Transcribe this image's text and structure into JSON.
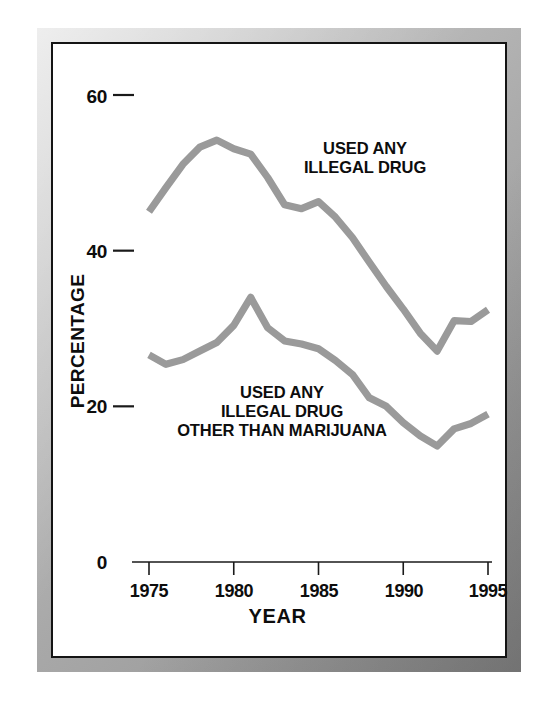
{
  "chart_data": {
    "type": "line",
    "title": "",
    "xlabel": "YEAR",
    "ylabel": "PERCENTAGE",
    "xlim": [
      1975,
      1995
    ],
    "ylim": [
      0,
      60
    ],
    "yticks": [
      0,
      20,
      40,
      60
    ],
    "ytick_labels": [
      "0",
      "20",
      "40",
      "60"
    ],
    "xticks": [
      1975,
      1980,
      1985,
      1990,
      1995
    ],
    "xtick_labels": [
      "1975",
      "1980",
      "1985",
      "1990",
      "1995"
    ],
    "grid": false,
    "legend_position": "inline-annotation",
    "line_color": "#9a9a9a",
    "axis_color": "#1a1a1a",
    "series": [
      {
        "name": "USED ANY ILLEGAL DRUG",
        "annotation": "USED ANY\nILLEGAL DRUG",
        "annotation_line_1": "USED ANY",
        "annotation_line_2": "ILLEGAL DRUG",
        "x": [
          1975,
          1976,
          1977,
          1978,
          1979,
          1980,
          1981,
          1982,
          1983,
          1984,
          1985,
          1986,
          1987,
          1988,
          1989,
          1990,
          1991,
          1992,
          1993,
          1994,
          1995
        ],
        "values": [
          45.0,
          48.1,
          51.1,
          53.3,
          54.2,
          53.1,
          52.4,
          49.4,
          45.9,
          45.4,
          46.3,
          44.3,
          41.7,
          38.5,
          35.4,
          32.5,
          29.4,
          27.1,
          31.0,
          30.9,
          32.4
        ]
      },
      {
        "name": "USED ANY ILLEGAL DRUG OTHER THAN MARIJUANA",
        "annotation": "USED ANY\nILLEGAL DRUG\nOTHER THAN MARIJUANA",
        "annotation_line_1": "USED ANY",
        "annotation_line_2": "ILLEGAL DRUG",
        "annotation_line_3": "OTHER THAN MARIJUANA",
        "x": [
          1975,
          1976,
          1977,
          1978,
          1979,
          1980,
          1981,
          1982,
          1983,
          1984,
          1985,
          1986,
          1987,
          1988,
          1989,
          1990,
          1991,
          1992,
          1993,
          1994,
          1995
        ],
        "values": [
          26.6,
          25.4,
          26.0,
          27.1,
          28.2,
          30.4,
          34.0,
          30.1,
          28.4,
          28.0,
          27.4,
          25.9,
          24.1,
          21.1,
          20.0,
          17.9,
          16.2,
          14.9,
          17.1,
          17.8,
          19.0
        ]
      }
    ]
  },
  "figure": {
    "frame_color": "#b0b0b0",
    "plate_border_color": "#141414",
    "background": "#ffffff"
  }
}
